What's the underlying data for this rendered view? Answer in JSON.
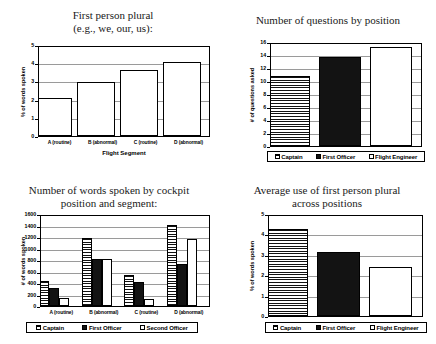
{
  "figure": {
    "panels": [
      "first-person-plural-by-segment",
      "questions-by-position",
      "words-by-position-and-segment",
      "avg-first-person-plural-by-position"
    ]
  },
  "legend_labels": {
    "captain": "Captain",
    "first_officer": "First Officer",
    "flight_engineer": "Flight Engineer",
    "second_officer": "Second Officer"
  },
  "chart_data": [
    {
      "id": "first-person-plural-by-segment",
      "type": "bar",
      "title": "First person plural\n(e.g., we, our, us):",
      "title_line1": "First person plural",
      "title_line2": "(e.g., we, our, us):",
      "xlabel": "Flight Segment",
      "ylabel": "% of words spoken",
      "categories": [
        "A (routine)",
        "B (abnormal)",
        "C (routine)",
        "D (abnormal)"
      ],
      "values": [
        2.1,
        2.95,
        3.65,
        4.08
      ],
      "ylim": [
        0,
        5
      ],
      "yticks": [
        0,
        1,
        2,
        3,
        4,
        5
      ],
      "grid": true,
      "legend": false,
      "series_style": "white"
    },
    {
      "id": "questions-by-position",
      "type": "bar",
      "title": "Number of questions by position",
      "title_line1": "Number of questions by position",
      "title_line2": "",
      "xlabel": "",
      "ylabel": "# of questions asked",
      "categories": [
        "Captain",
        "First Officer",
        "Flight Engineer"
      ],
      "values": [
        10.7,
        13.65,
        15.3
      ],
      "ylim": [
        0,
        16
      ],
      "yticks": [
        0,
        2,
        4,
        6,
        8,
        10,
        12,
        14,
        16
      ],
      "grid": true,
      "legend": true,
      "legend_position": "bottom",
      "legend_entries": [
        "Captain",
        "First Officer",
        "Flight Engineer"
      ],
      "styles": [
        "striped",
        "black",
        "white"
      ]
    },
    {
      "id": "words-by-position-and-segment",
      "type": "bar",
      "title": "Number of words spoken by cockpit\nposition and segment:",
      "title_line1": "Number of words spoken by cockpit",
      "title_line2": "position and segment:",
      "xlabel": "",
      "ylabel": "# of words spoken",
      "categories": [
        "A (routine)",
        "B (abnormal)",
        "C (routine)",
        "D (abnormal)"
      ],
      "series": [
        {
          "name": "Captain",
          "style": "striped",
          "values": [
            440,
            1190,
            535,
            1405
          ]
        },
        {
          "name": "First Officer",
          "style": "black",
          "values": [
            320,
            815,
            425,
            735
          ]
        },
        {
          "name": "Second Officer",
          "style": "white",
          "values": [
            145,
            820,
            115,
            1160
          ]
        }
      ],
      "ylim": [
        0,
        1600
      ],
      "yticks": [
        0,
        200,
        400,
        600,
        800,
        1000,
        1200,
        1400,
        1600
      ],
      "grid": true,
      "legend": true,
      "legend_position": "bottom",
      "legend_entries": [
        "Captain",
        "First Officer",
        "Second Officer"
      ]
    },
    {
      "id": "avg-first-person-plural-by-position",
      "type": "bar",
      "title": "Average use of first person plural\nacross positions",
      "title_line1": "Average use of first person plural",
      "title_line2": "across positions",
      "xlabel": "",
      "ylabel": "% of words spoken",
      "categories": [
        "Captain",
        "First Officer",
        "Flight Engineer"
      ],
      "values": [
        4.25,
        3.12,
        2.42
      ],
      "ylim": [
        0,
        5
      ],
      "yticks": [
        0,
        1,
        2,
        3,
        4,
        5
      ],
      "grid": true,
      "legend": true,
      "legend_position": "bottom",
      "legend_entries": [
        "Captain",
        "First Officer",
        "Flight Engineer"
      ],
      "styles": [
        "striped",
        "black",
        "white"
      ]
    }
  ]
}
